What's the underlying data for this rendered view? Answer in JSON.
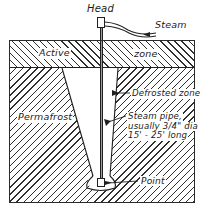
{
  "diagram": {
    "labels": {
      "head": "Head",
      "steam": "Steam",
      "active_left": "Active",
      "active_right": "zone",
      "permafrost": "Permafrost",
      "defrosted_zone": "Defrosted zone",
      "point": "Point",
      "steam_pipe_line1": "Steam pipe,",
      "steam_pipe_line2": "usually 3/4\" dia",
      "steam_pipe_line3": "15' - 25' long"
    },
    "colors": {
      "ink": "#1f1f1f",
      "hatch": "#2f2f2f",
      "pipe_fill": "#9a9a9a",
      "paper": "#ffffff"
    }
  }
}
